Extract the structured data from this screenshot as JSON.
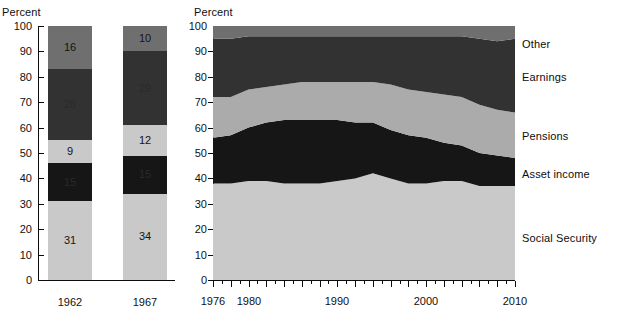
{
  "figure": {
    "left_panel": {
      "axis_title": "Percent",
      "y_ticks": [
        "100",
        "90",
        "80",
        "70",
        "60",
        "50",
        "40",
        "30",
        "20",
        "10",
        "0"
      ],
      "bars": [
        {
          "label": "1962",
          "segments": [
            {
              "category": "Social Security",
              "value": 31,
              "label": "31",
              "color": "#c9c9c9",
              "tone": "light"
            },
            {
              "category": "Asset income",
              "value": 15,
              "label": "15",
              "color": "#161616",
              "tone": "dark"
            },
            {
              "category": "Pensions",
              "value": 9,
              "label": "9",
              "color": "#c9c9c9",
              "tone": "light"
            },
            {
              "category": "Earnings",
              "value": 28,
              "label": "28",
              "color": "#323232",
              "tone": "dark"
            },
            {
              "category": "Other",
              "value": 17,
              "label": "16",
              "color": "#6f6f6f",
              "tone": "mid"
            }
          ]
        },
        {
          "label": "1967",
          "segments": [
            {
              "category": "Social Security",
              "value": 34,
              "label": "34",
              "color": "#c9c9c9",
              "tone": "light"
            },
            {
              "category": "Asset income",
              "value": 15,
              "label": "15",
              "color": "#161616",
              "tone": "dark"
            },
            {
              "category": "Pensions",
              "value": 12,
              "label": "12",
              "color": "#c9c9c9",
              "tone": "light"
            },
            {
              "category": "Earnings",
              "value": 29,
              "label": "29",
              "color": "#323232",
              "tone": "dark"
            },
            {
              "category": "Other",
              "value": 10,
              "label": "10",
              "color": "#6f6f6f",
              "tone": "mid"
            }
          ]
        }
      ]
    },
    "right_panel": {
      "axis_title": "Percent",
      "y_ticks": [
        "100",
        "90",
        "80",
        "70",
        "60",
        "50",
        "40",
        "30",
        "20",
        "10",
        "0"
      ],
      "x_tick_labels": [
        "1976",
        "1980",
        "1990",
        "2000",
        "2010"
      ],
      "legend": [
        {
          "label": "Other",
          "color": "#6f6f6f"
        },
        {
          "label": "Earnings",
          "color": "#323232"
        },
        {
          "label": "Pensions",
          "color": "#ababab"
        },
        {
          "label": "Asset income",
          "color": "#161616"
        },
        {
          "label": "Social Security",
          "color": "#c9c9c9"
        }
      ]
    }
  },
  "chart_data": {
    "type": "area",
    "title": "",
    "subtitle": "",
    "xlabel": "",
    "ylabel": "Percent",
    "ylim": [
      0,
      100
    ],
    "grid": false,
    "legend_position": "right",
    "panels": [
      {
        "name": "left-stacked-bars",
        "type": "bar",
        "stacked": true,
        "ylabel": "Percent",
        "ylim": [
          0,
          100
        ],
        "categories": [
          "1962",
          "1967"
        ],
        "series": [
          {
            "name": "Social Security",
            "values": [
              31,
              34
            ],
            "color": "#c9c9c9"
          },
          {
            "name": "Asset income",
            "values": [
              15,
              15
            ],
            "color": "#161616"
          },
          {
            "name": "Pensions",
            "values": [
              9,
              12
            ],
            "color": "#c9c9c9"
          },
          {
            "name": "Earnings",
            "values": [
              28,
              29
            ],
            "color": "#323232"
          },
          {
            "name": "Other",
            "values": [
              17,
              10
            ],
            "color": "#6f6f6f"
          }
        ],
        "data_labels": [
          [
            "31",
            "15",
            "9",
            "28",
            "16"
          ],
          [
            "34",
            "15",
            "12",
            "29",
            "10"
          ]
        ]
      },
      {
        "name": "right-stacked-area",
        "type": "area",
        "stacked": true,
        "ylabel": "Percent",
        "ylim": [
          0,
          100
        ],
        "xlim": [
          1976,
          2010
        ],
        "x": [
          1976,
          1978,
          1980,
          1982,
          1984,
          1986,
          1988,
          1990,
          1992,
          1994,
          1996,
          1998,
          2000,
          2002,
          2004,
          2006,
          2008,
          2010
        ],
        "series": [
          {
            "name": "Social Security",
            "color": "#c9c9c9",
            "values": [
              38,
              38,
              39,
              39,
              38,
              38,
              38,
              39,
              40,
              42,
              40,
              38,
              38,
              39,
              39,
              37,
              37,
              37
            ]
          },
          {
            "name": "Asset income",
            "color": "#161616",
            "values": [
              18,
              19,
              21,
              23,
              25,
              25,
              25,
              24,
              22,
              20,
              19,
              19,
              18,
              15,
              14,
              13,
              12,
              11
            ]
          },
          {
            "name": "Pensions",
            "color": "#ababab",
            "values": [
              16,
              15,
              15,
              14,
              14,
              15,
              15,
              15,
              16,
              16,
              18,
              18,
              18,
              19,
              19,
              19,
              18,
              18
            ]
          },
          {
            "name": "Earnings",
            "color": "#323232",
            "values": [
              23,
              23,
              21,
              20,
              19,
              18,
              18,
              18,
              18,
              18,
              19,
              21,
              22,
              23,
              24,
              26,
              27,
              29
            ]
          },
          {
            "name": "Other",
            "color": "#6f6f6f",
            "values": [
              5,
              5,
              4,
              4,
              4,
              4,
              4,
              4,
              4,
              4,
              4,
              4,
              4,
              4,
              4,
              5,
              6,
              5
            ]
          }
        ]
      }
    ]
  }
}
